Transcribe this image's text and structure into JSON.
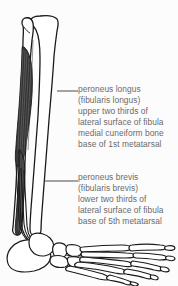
{
  "figure": {
    "background_color": "#fcfcfc",
    "text_color": "#6b6b6b",
    "outline_color": "#1a1a1a",
    "muscle_fill_color": "#3a3a3a",
    "bone_fill_color": "#ffffff"
  },
  "labels": [
    {
      "id": "peroneus-longus",
      "lines": [
        "peroneus longus",
        "(fibularis longus)",
        "upper two thirds of",
        "lateral surface of fibula",
        "medial cuneiform bone",
        "base of 1st metatarsal"
      ]
    },
    {
      "id": "peroneus-brevis",
      "lines": [
        "peroneus brevis",
        "(fibularis brevis)",
        "lower two thirds of",
        "lateral surface of fibula",
        "base of 5th metatarsal"
      ]
    }
  ],
  "leader_lines": [
    {
      "id": "leader-peroneus-longus",
      "x1": 57,
      "y1": 91,
      "x2": 78,
      "y2": 91
    },
    {
      "id": "leader-peroneus-brevis",
      "x1": 44,
      "y1": 181,
      "x2": 78,
      "y2": 181
    }
  ]
}
